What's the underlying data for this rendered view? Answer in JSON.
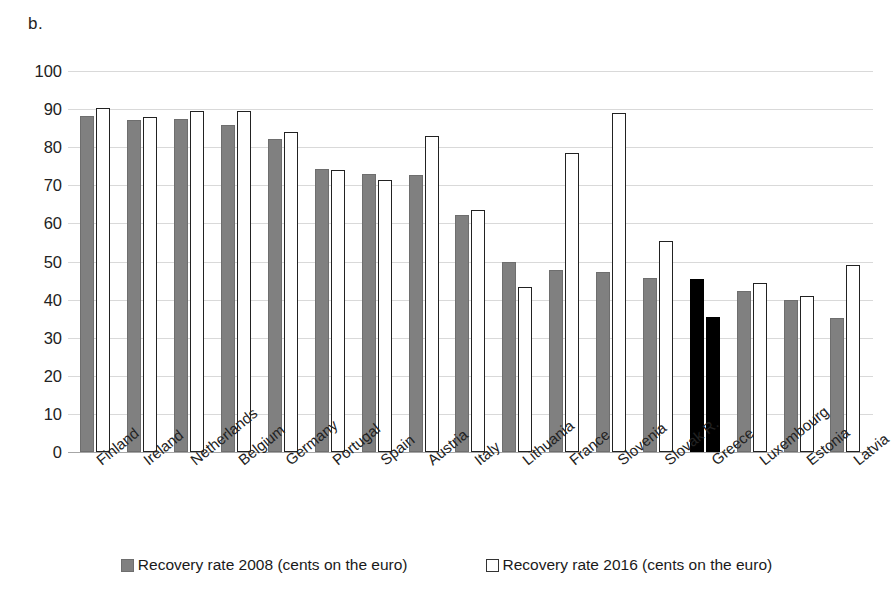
{
  "figure": {
    "panel_label": "b."
  },
  "chart_data": {
    "type": "bar",
    "title": "",
    "xlabel": "",
    "ylabel": "",
    "ylim": [
      0,
      100
    ],
    "yticks": [
      100,
      90,
      80,
      70,
      60,
      50,
      40,
      30,
      20,
      10,
      0
    ],
    "grid": true,
    "legend_position": "bottom",
    "categories": [
      "Finland",
      "Ireland",
      "Netherlands",
      "Belgium",
      "Germany",
      "Portugal",
      "Spain",
      "Austria",
      "Italy",
      "Lithuania",
      "France",
      "Slovenia",
      "Slovak R.",
      "Greece",
      "Luxembourg",
      "Estonia",
      "Latvia"
    ],
    "series": [
      {
        "name": "Recovery rate 2008 (cents on the euro)",
        "color": "#808080",
        "values": [
          88.1,
          87.2,
          87.3,
          85.8,
          82.1,
          74.3,
          72.9,
          72.8,
          62.1,
          49.9,
          47.9,
          47.3,
          45.7,
          45.4,
          42.3,
          40.0,
          35.3
        ]
      },
      {
        "name": "Recovery rate 2016 (cents on the euro)",
        "color": "#ffffff",
        "values": [
          90.3,
          88.0,
          89.4,
          89.5,
          84.0,
          73.9,
          71.4,
          83.0,
          63.5,
          43.3,
          78.4,
          89.0,
          55.4,
          35.4,
          44.4,
          40.9,
          49.0
        ]
      }
    ],
    "highlight": {
      "category": "Greece",
      "color": "#000000"
    }
  },
  "legend": {
    "items": [
      {
        "swatch": "grey-square-icon",
        "label": "Recovery rate 2008 (cents on the euro)"
      },
      {
        "swatch": "white-square-icon",
        "label": "Recovery rate 2016 (cents on the euro)"
      }
    ]
  }
}
